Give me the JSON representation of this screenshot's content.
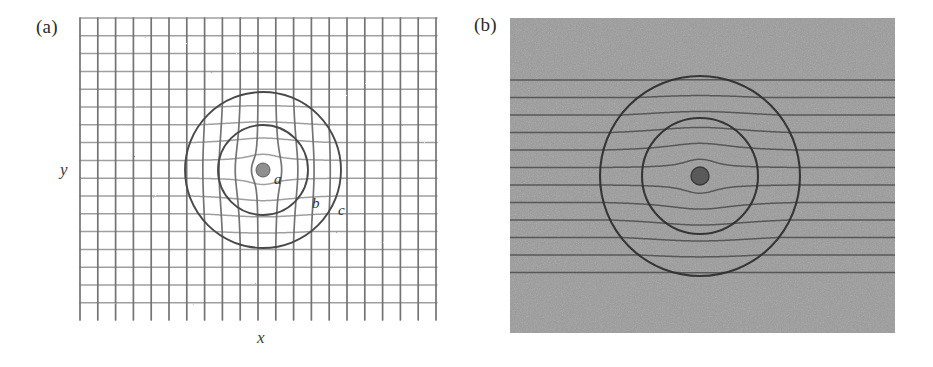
{
  "figure": {
    "panels": [
      {
        "id": "a",
        "label": "(a)",
        "kind": "grid-diagram",
        "axis_x_label": "x",
        "axis_y_label": "y",
        "radius_labels": [
          "a",
          "b",
          "c"
        ],
        "background": "#ffffff",
        "grid_line_color_vertical": "#6f6f6f",
        "grid_line_color_horizontal": "#9a9a9a",
        "circle_color": "#4a4a4a",
        "core_fill": "#8f8f8f"
      },
      {
        "id": "b",
        "label": "(b)",
        "kind": "grayscale-photo",
        "background": "#9c9c9c",
        "line_color": "#4d4d4d",
        "circle_color": "#2e2e2e",
        "core_fill": "#5a5a5a"
      }
    ]
  },
  "chart_data": {
    "type": "diagram",
    "title": "",
    "panels": [
      {
        "id": "a",
        "label": "(a)",
        "type": "distorted-cartesian-grid",
        "xlabel": "x",
        "ylabel": "y",
        "frame": {
          "x": 80,
          "y": 18,
          "width": 357,
          "height": 302
        },
        "grid": {
          "n_vertical_lines": 21,
          "n_horizontal_lines": 18,
          "cell_size_px": 17.8,
          "vertical_line_color": "#6f6f6f",
          "horizontal_line_color": "#9a9a9a"
        },
        "cloak": {
          "center_x": 263,
          "center_y": 170,
          "radius_a": 7,
          "radius_b": 45,
          "radius_c": 78,
          "annotations": [
            {
              "text": "a",
              "x": 274,
              "y": 184
            },
            {
              "text": "b",
              "x": 312,
              "y": 208
            },
            {
              "text": "c",
              "x": 338,
              "y": 215
            }
          ]
        }
      },
      {
        "id": "b",
        "label": "(b)",
        "type": "ray-trace-photo",
        "frame": {
          "x": 510,
          "y": 18,
          "width": 385,
          "height": 315
        },
        "background_gray": "#9c9c9c",
        "horizontal_lines": {
          "count": 12,
          "first_y": 80,
          "spacing_px": 17.5,
          "color": "#4d4d4d"
        },
        "cloak": {
          "center_x": 700,
          "center_y": 176,
          "radius_a": 9,
          "radius_b": 58,
          "radius_c": 100
        }
      }
    ]
  }
}
